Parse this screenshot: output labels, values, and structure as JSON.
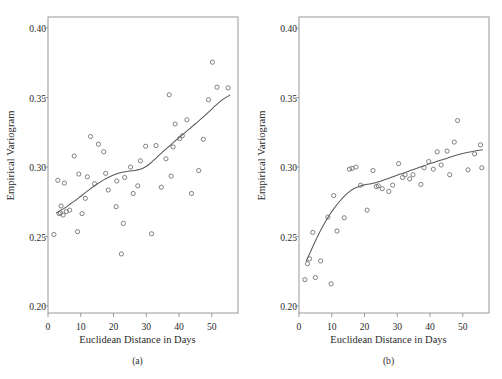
{
  "figure": {
    "panels": [
      {
        "key": "a",
        "subcaption": "(a)",
        "xlabel": "Euclidean Distance in Days",
        "ylabel": "Empirical Variogram"
      },
      {
        "key": "b",
        "subcaption": "(b)",
        "xlabel": "Euclidean Distance in Days",
        "ylabel": "Empirical Variogram"
      }
    ]
  },
  "chart_data": [
    {
      "type": "scatter",
      "panel": "(a)",
      "title": "",
      "xlabel": "Euclidean Distance in Days",
      "ylabel": "Empirical Variogram",
      "xlim": [
        0,
        58
      ],
      "ylim": [
        0.195,
        0.408
      ],
      "xticks": [
        0,
        10,
        20,
        30,
        40,
        50
      ],
      "xticklabels": [
        "0",
        "10",
        "20",
        "30",
        "40",
        "50"
      ],
      "yticks": [
        0.2,
        0.25,
        0.3,
        0.35,
        0.4
      ],
      "yticklabels": [
        "0.20",
        "0.25",
        "0.30",
        "0.35",
        "0.40"
      ],
      "grid": false,
      "legend": null,
      "series": [
        {
          "name": "empirical variogram points",
          "marker": "open-circle",
          "points": [
            [
              1.8,
              0.2515
            ],
            [
              3.0,
              0.2905
            ],
            [
              3.4,
              0.2665
            ],
            [
              3.8,
              0.267
            ],
            [
              4.0,
              0.272
            ],
            [
              4.6,
              0.2655
            ],
            [
              5.0,
              0.2885
            ],
            [
              5.6,
              0.268
            ],
            [
              6.6,
              0.269
            ],
            [
              8.0,
              0.308
            ],
            [
              9.0,
              0.2535
            ],
            [
              9.4,
              0.295
            ],
            [
              10.4,
              0.2665
            ],
            [
              11.4,
              0.2775
            ],
            [
              12.0,
              0.293
            ],
            [
              13.0,
              0.322
            ],
            [
              14.2,
              0.288
            ],
            [
              15.4,
              0.3165
            ],
            [
              17.0,
              0.311
            ],
            [
              17.6,
              0.2955
            ],
            [
              18.4,
              0.2835
            ],
            [
              20.8,
              0.2715
            ],
            [
              21.0,
              0.29
            ],
            [
              22.4,
              0.2375
            ],
            [
              23.0,
              0.2595
            ],
            [
              23.4,
              0.2925
            ],
            [
              25.2,
              0.3
            ],
            [
              26.0,
              0.281
            ],
            [
              27.4,
              0.2865
            ],
            [
              28.2,
              0.3045
            ],
            [
              29.8,
              0.315
            ],
            [
              31.6,
              0.252
            ],
            [
              33.0,
              0.3155
            ],
            [
              34.6,
              0.2855
            ],
            [
              36.0,
              0.306
            ],
            [
              37.0,
              0.352
            ],
            [
              37.6,
              0.2935
            ],
            [
              38.2,
              0.3145
            ],
            [
              38.8,
              0.331
            ],
            [
              40.2,
              0.3205
            ],
            [
              41.0,
              0.3225
            ],
            [
              42.4,
              0.334
            ],
            [
              43.8,
              0.281
            ],
            [
              46.0,
              0.2975
            ],
            [
              47.4,
              0.32
            ],
            [
              49.0,
              0.3485
            ],
            [
              50.2,
              0.3755
            ],
            [
              51.6,
              0.3575
            ],
            [
              55.0,
              0.357
            ]
          ]
        }
      ],
      "fitted_curve": {
        "name": "smoothed fit",
        "points": [
          [
            2.6,
            0.2672
          ],
          [
            4.0,
            0.269
          ],
          [
            5.5,
            0.2712
          ],
          [
            7.0,
            0.2738
          ],
          [
            8.5,
            0.2762
          ],
          [
            10.0,
            0.279
          ],
          [
            11.5,
            0.2818
          ],
          [
            13.0,
            0.2845
          ],
          [
            15.0,
            0.2878
          ],
          [
            17.0,
            0.2908
          ],
          [
            19.0,
            0.2932
          ],
          [
            21.0,
            0.2952
          ],
          [
            23.0,
            0.2965
          ],
          [
            25.0,
            0.2972
          ],
          [
            27.0,
            0.2978
          ],
          [
            29.0,
            0.2992
          ],
          [
            31.0,
            0.3022
          ],
          [
            33.0,
            0.3065
          ],
          [
            35.0,
            0.311
          ],
          [
            37.0,
            0.315
          ],
          [
            39.0,
            0.3192
          ],
          [
            41.0,
            0.3232
          ],
          [
            43.0,
            0.3272
          ],
          [
            45.0,
            0.3312
          ],
          [
            47.0,
            0.3352
          ],
          [
            49.0,
            0.3395
          ],
          [
            51.0,
            0.344
          ],
          [
            53.0,
            0.348
          ],
          [
            55.5,
            0.3518
          ]
        ]
      }
    },
    {
      "type": "scatter",
      "panel": "(b)",
      "title": "",
      "xlabel": "Euclidean Distance in Days",
      "ylabel": "Empirical Variogram",
      "xlim": [
        0,
        58
      ],
      "ylim": [
        0.195,
        0.408
      ],
      "xticks": [
        0,
        10,
        20,
        30,
        40,
        50
      ],
      "xticklabels": [
        "0",
        "10",
        "20",
        "30",
        "40",
        "50"
      ],
      "yticks": [
        0.2,
        0.25,
        0.3,
        0.35,
        0.4
      ],
      "yticklabels": [
        "0.20",
        "0.25",
        "0.30",
        "0.35",
        "0.40"
      ],
      "grid": false,
      "legend": null,
      "series": [
        {
          "name": "empirical variogram points",
          "marker": "open-circle",
          "points": [
            [
              1.8,
              0.219
            ],
            [
              2.6,
              0.2305
            ],
            [
              3.2,
              0.234
            ],
            [
              4.2,
              0.253
            ],
            [
              5.0,
              0.2205
            ],
            [
              6.6,
              0.2325
            ],
            [
              8.8,
              0.264
            ],
            [
              9.8,
              0.216
            ],
            [
              10.6,
              0.2795
            ],
            [
              11.6,
              0.254
            ],
            [
              13.8,
              0.2635
            ],
            [
              15.4,
              0.2985
            ],
            [
              16.2,
              0.299
            ],
            [
              17.4,
              0.3
            ],
            [
              18.8,
              0.287
            ],
            [
              20.8,
              0.269
            ],
            [
              22.6,
              0.2975
            ],
            [
              23.6,
              0.286
            ],
            [
              24.2,
              0.2865
            ],
            [
              25.4,
              0.2845
            ],
            [
              27.4,
              0.2825
            ],
            [
              28.6,
              0.287
            ],
            [
              30.4,
              0.3025
            ],
            [
              31.6,
              0.2925
            ],
            [
              32.4,
              0.2945
            ],
            [
              33.8,
              0.2915
            ],
            [
              34.8,
              0.2945
            ],
            [
              37.2,
              0.2875
            ],
            [
              38.2,
              0.2995
            ],
            [
              39.6,
              0.304
            ],
            [
              41.0,
              0.2985
            ],
            [
              42.2,
              0.311
            ],
            [
              43.4,
              0.3015
            ],
            [
              45.2,
              0.3115
            ],
            [
              46.0,
              0.2945
            ],
            [
              47.4,
              0.318
            ],
            [
              48.4,
              0.3335
            ],
            [
              51.6,
              0.298
            ],
            [
              53.6,
              0.3095
            ],
            [
              55.4,
              0.316
            ],
            [
              55.8,
              0.2995
            ]
          ]
        }
      ],
      "fitted_curve": {
        "name": "smoothed fit",
        "points": [
          [
            2.2,
            0.2322
          ],
          [
            3.5,
            0.239
          ],
          [
            5.0,
            0.2468
          ],
          [
            6.5,
            0.254
          ],
          [
            8.0,
            0.2605
          ],
          [
            9.5,
            0.2662
          ],
          [
            11.0,
            0.2712
          ],
          [
            12.5,
            0.2756
          ],
          [
            14.0,
            0.2795
          ],
          [
            15.5,
            0.2825
          ],
          [
            17.0,
            0.2848
          ],
          [
            18.5,
            0.2862
          ],
          [
            20.0,
            0.2872
          ],
          [
            22.0,
            0.288
          ],
          [
            24.0,
            0.2892
          ],
          [
            26.0,
            0.2908
          ],
          [
            28.0,
            0.2925
          ],
          [
            30.0,
            0.2942
          ],
          [
            32.0,
            0.2958
          ],
          [
            34.0,
            0.2975
          ],
          [
            36.0,
            0.2992
          ],
          [
            38.0,
            0.3008
          ],
          [
            40.0,
            0.3025
          ],
          [
            42.0,
            0.304
          ],
          [
            44.0,
            0.3055
          ],
          [
            46.0,
            0.307
          ],
          [
            48.0,
            0.3085
          ],
          [
            50.0,
            0.3098
          ],
          [
            52.0,
            0.3108
          ],
          [
            54.0,
            0.3118
          ],
          [
            56.0,
            0.3125
          ]
        ]
      }
    }
  ]
}
